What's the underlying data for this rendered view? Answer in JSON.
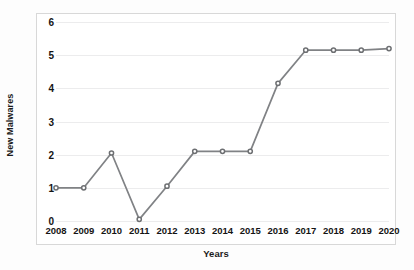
{
  "chart_data": {
    "type": "line",
    "title": "",
    "xlabel": "Years",
    "ylabel": "New Malwares",
    "categories": [
      "2008",
      "2009",
      "2010",
      "2011",
      "2012",
      "2013",
      "2014",
      "2015",
      "2016",
      "2017",
      "2018",
      "2019",
      "2020"
    ],
    "values": [
      1.0,
      1.0,
      2.05,
      0.05,
      1.05,
      2.1,
      2.1,
      2.1,
      4.15,
      5.15,
      5.15,
      5.15,
      5.2
    ],
    "series": [
      {
        "name": "New Malwares",
        "values": [
          1.0,
          1.0,
          2.05,
          0.05,
          1.05,
          2.1,
          2.1,
          2.1,
          4.15,
          5.15,
          5.15,
          5.15,
          5.2
        ]
      }
    ],
    "yticks": [
      "0",
      "1",
      "2",
      "3",
      "4",
      "5",
      "6"
    ],
    "ylim": [
      0,
      6
    ],
    "grid": true,
    "legend": false,
    "legend_position": "none",
    "line_color": "#808285",
    "marker_color": "#6d6f72",
    "grid_color": "#ececed",
    "frame_color": "#d8d8d8",
    "text_color": "#141414",
    "background": "#ffffff"
  }
}
